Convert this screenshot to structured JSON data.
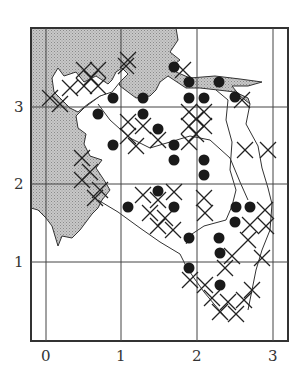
{
  "figure": {
    "type": "distribution-map",
    "x_ticks": [
      "0",
      "1",
      "2",
      "3"
    ],
    "y_ticks": [
      "1",
      "2",
      "3"
    ],
    "legend": {
      "filled_circle": "record (dot)",
      "cross": "record (cross)",
      "shaded": "sea / water"
    },
    "colors": {
      "ink": "#222222",
      "sea": "#bdbdbd",
      "background": "#ffffff"
    },
    "dots": [
      [
        174,
        67
      ],
      [
        189,
        82
      ],
      [
        219,
        82
      ],
      [
        98,
        114
      ],
      [
        113,
        98
      ],
      [
        143,
        98
      ],
      [
        189,
        98
      ],
      [
        204,
        98
      ],
      [
        235,
        97
      ],
      [
        143,
        114
      ],
      [
        113,
        145
      ],
      [
        158,
        129
      ],
      [
        174,
        145
      ],
      [
        174,
        160
      ],
      [
        204,
        160
      ],
      [
        204,
        175
      ],
      [
        158,
        191
      ],
      [
        174,
        207
      ],
      [
        128,
        207
      ],
      [
        236,
        207
      ],
      [
        250,
        207
      ],
      [
        235,
        222
      ],
      [
        189,
        238
      ],
      [
        219,
        238
      ],
      [
        220,
        253
      ],
      [
        189,
        268
      ],
      [
        220,
        285
      ]
    ],
    "crosses": [
      [
        84,
        70
      ],
      [
        98,
        70
      ],
      [
        91,
        78
      ],
      [
        84,
        86
      ],
      [
        98,
        86
      ],
      [
        126,
        66
      ],
      [
        70,
        88
      ],
      [
        50,
        98
      ],
      [
        60,
        104
      ],
      [
        128,
        122
      ],
      [
        143,
        126
      ],
      [
        128,
        136
      ],
      [
        158,
        140
      ],
      [
        136,
        146
      ],
      [
        189,
        112
      ],
      [
        204,
        112
      ],
      [
        189,
        126
      ],
      [
        204,
        126
      ],
      [
        196,
        119
      ],
      [
        196,
        134
      ],
      [
        189,
        142
      ],
      [
        128,
        60
      ],
      [
        183,
        70
      ],
      [
        245,
        150
      ],
      [
        268,
        150
      ],
      [
        242,
        100
      ],
      [
        82,
        158
      ],
      [
        90,
        172
      ],
      [
        82,
        180
      ],
      [
        100,
        190
      ],
      [
        95,
        198
      ],
      [
        143,
        195
      ],
      [
        158,
        200
      ],
      [
        174,
        192
      ],
      [
        150,
        213
      ],
      [
        165,
        218
      ],
      [
        158,
        226
      ],
      [
        173,
        230
      ],
      [
        205,
        213
      ],
      [
        204,
        198
      ],
      [
        265,
        210
      ],
      [
        266,
        226
      ],
      [
        250,
        225
      ],
      [
        190,
        280
      ],
      [
        205,
        285
      ],
      [
        225,
        268
      ],
      [
        212,
        298
      ],
      [
        228,
        302
      ],
      [
        244,
        300
      ],
      [
        220,
        312
      ],
      [
        236,
        314
      ],
      [
        252,
        290
      ],
      [
        262,
        258
      ],
      [
        248,
        240
      ],
      [
        232,
        256
      ]
    ]
  }
}
